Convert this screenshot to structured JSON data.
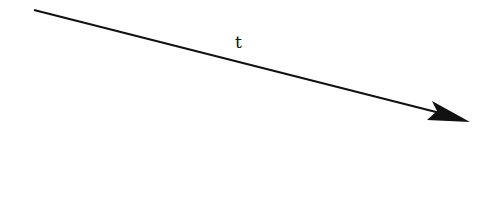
{
  "diagram": {
    "arrow": {
      "label": "t",
      "start": [
        34,
        10
      ],
      "end": [
        470,
        122
      ],
      "color": "#111111"
    }
  }
}
